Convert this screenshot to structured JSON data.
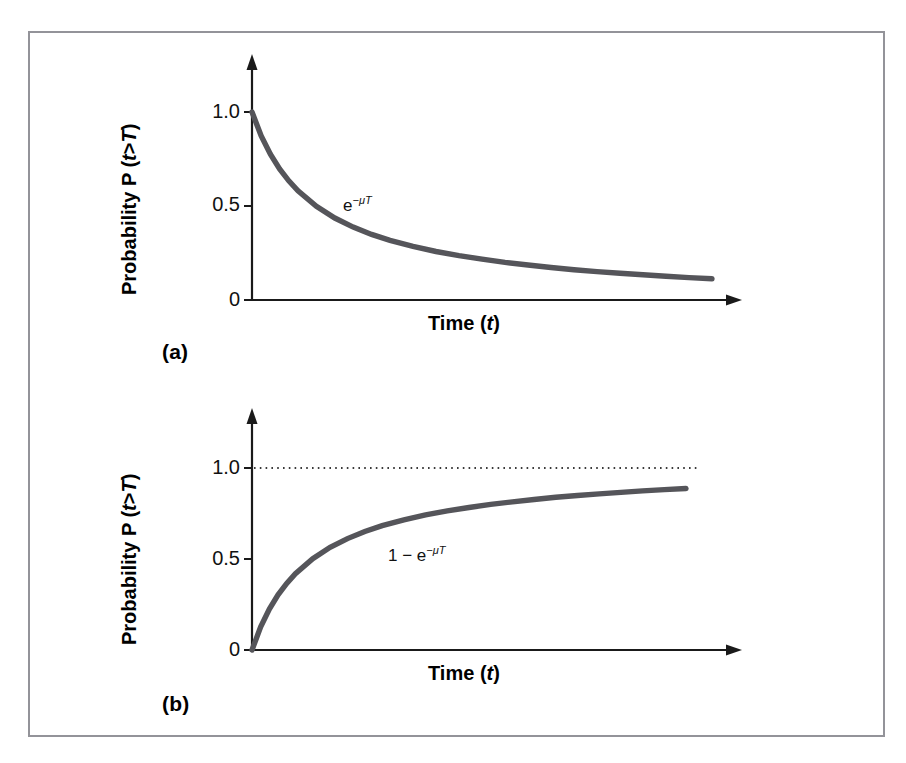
{
  "figure": {
    "background_color": "#ffffff",
    "frame_color": "#939399",
    "curve_color": "#55555a",
    "axis_color": "#1a1a1a",
    "dotted_color": "#3a3a3a"
  },
  "panels": [
    {
      "id": "a",
      "label": "(a)",
      "xlabel_text": "Time (",
      "xlabel_var": "t",
      "xlabel_close": ")",
      "ylabel_prefix": "Probability P (",
      "ylabel_var1": "t",
      "ylabel_gt": ">",
      "ylabel_var2": "T",
      "ylabel_close": ")",
      "yticks": [
        "1.0",
        "0.5",
        "0"
      ],
      "curve_label_base": "e",
      "curve_label_exp": "−μT",
      "curve_label_full": "e−μT"
    },
    {
      "id": "b",
      "label": "(b)",
      "xlabel_text": "Time (",
      "xlabel_var": "t",
      "xlabel_close": ")",
      "ylabel_prefix": "Probability P (",
      "ylabel_var1": "t",
      "ylabel_gt": ">",
      "ylabel_var2": "T",
      "ylabel_close": ")",
      "yticks": [
        "1.0",
        "0.5",
        "0"
      ],
      "curve_label_base": "1 − e",
      "curve_label_exp": "−μT",
      "curve_label_full": "1 − e−μT"
    }
  ],
  "chart_data": [
    {
      "type": "line",
      "title": "",
      "panel": "(a)",
      "xlabel": "Time (t)",
      "ylabel": "Probability P (t>T)",
      "xticks": [],
      "yticks": [
        0,
        0.5,
        1.0
      ],
      "ytick_labels": [
        "0",
        "0.5",
        "1.0"
      ],
      "xlim": [
        0,
        1
      ],
      "ylim": [
        0,
        1.25
      ],
      "grid": false,
      "legend": "none",
      "annotations": [
        {
          "text": "e^(-μT)",
          "x": 0.24,
          "y": 0.43
        }
      ],
      "series": [
        {
          "name": "e^(-μT)",
          "formula": "exp(-mu*T)",
          "color": "#55555a",
          "x": [
            0.0,
            0.02,
            0.04,
            0.06,
            0.08,
            0.1,
            0.14,
            0.18,
            0.22,
            0.26,
            0.3,
            0.35,
            0.4,
            0.45,
            0.5,
            0.55,
            0.6,
            0.65,
            0.7,
            0.75,
            0.8,
            0.85,
            0.9,
            0.95,
            1.0
          ],
          "values": [
            1.0,
            0.873,
            0.775,
            0.697,
            0.634,
            0.581,
            0.498,
            0.436,
            0.388,
            0.349,
            0.317,
            0.285,
            0.258,
            0.236,
            0.217,
            0.2,
            0.186,
            0.173,
            0.161,
            0.151,
            0.142,
            0.134,
            0.126,
            0.119,
            0.113
          ]
        }
      ]
    },
    {
      "type": "line",
      "title": "",
      "panel": "(b)",
      "xlabel": "Time (t)",
      "ylabel": "Probability P (t>T)",
      "xticks": [],
      "yticks": [
        0,
        0.5,
        1.0
      ],
      "ytick_labels": [
        "0",
        "0.5",
        "1.0"
      ],
      "xlim": [
        0,
        1
      ],
      "ylim": [
        0,
        1.25
      ],
      "grid": false,
      "legend": "none",
      "reference_lines": [
        {
          "type": "horizontal",
          "y": 1.0,
          "style": "dotted",
          "color": "#3a3a3a"
        }
      ],
      "annotations": [
        {
          "text": "1 - e^(-μT)",
          "x": 0.42,
          "y": 0.6
        }
      ],
      "series": [
        {
          "name": "1 - e^(-μT)",
          "formula": "1 - exp(-mu*T)",
          "color": "#55555a",
          "x": [
            0.0,
            0.02,
            0.04,
            0.06,
            0.08,
            0.1,
            0.14,
            0.18,
            0.22,
            0.26,
            0.3,
            0.35,
            0.4,
            0.45,
            0.5,
            0.55,
            0.6,
            0.65,
            0.7,
            0.75,
            0.8,
            0.85,
            0.9,
            0.95,
            1.0
          ],
          "values": [
            0.0,
            0.127,
            0.225,
            0.303,
            0.366,
            0.419,
            0.502,
            0.564,
            0.612,
            0.651,
            0.683,
            0.715,
            0.742,
            0.764,
            0.783,
            0.8,
            0.814,
            0.827,
            0.839,
            0.849,
            0.858,
            0.866,
            0.874,
            0.881,
            0.887
          ]
        }
      ]
    }
  ]
}
